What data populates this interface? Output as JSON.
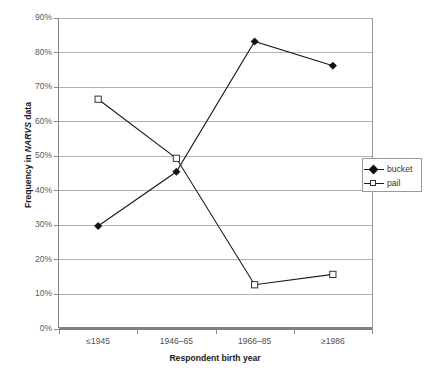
{
  "chart_data": {
    "type": "line",
    "title": "",
    "subtitle": "",
    "xlabel": "Respondent birth year",
    "ylabel": "Frequency in NARVS data",
    "ylabel_italic_part": "NARVS",
    "categories": [
      "≤1945",
      "1946–65",
      "1966–85",
      "≥1986"
    ],
    "series": [
      {
        "name": "bucket",
        "marker": "filled-diamond",
        "values": [
          29.8,
          45.5,
          83.2,
          76.2
        ]
      },
      {
        "name": "pail",
        "marker": "open-square",
        "values": [
          66.5,
          49.4,
          12.8,
          15.8
        ]
      }
    ],
    "ylim": [
      0,
      90
    ],
    "ytick_values": [
      0,
      10,
      20,
      30,
      40,
      50,
      60,
      70,
      80,
      90
    ],
    "ytick_labels": [
      "0%",
      "10%",
      "20%",
      "30%",
      "40%",
      "50%",
      "60%",
      "70%",
      "80%",
      "90%"
    ],
    "grid": true,
    "grid_axis": "y",
    "legend_position": "right",
    "value_units": "percent",
    "colors": {
      "series_line": "#1a1a1a",
      "gridline": "#b3b3b3",
      "axis": "#808080",
      "tick_text": "#595959",
      "title_text": "#1a1a1a",
      "plot_background": "#ffffff"
    }
  },
  "legend": {
    "entries": [
      {
        "label": "bucket",
        "marker": "filled-diamond"
      },
      {
        "label": "pail",
        "marker": "open-square"
      }
    ]
  },
  "axes": {
    "x_title": "Respondent birth year",
    "y_title_prefix": "Frequency in ",
    "y_title_italic": "NARVS",
    "y_title_suffix": " data"
  },
  "caption": {
    "remnant_text": ""
  }
}
